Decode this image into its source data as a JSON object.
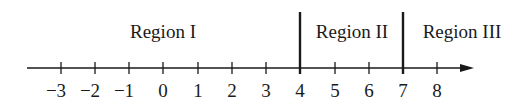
{
  "diagram": {
    "type": "number-line",
    "axis": {
      "from": -3,
      "to": 8,
      "arrow": "right"
    },
    "ticks": [
      "−3",
      "−2",
      "−1",
      "0",
      "1",
      "2",
      "3",
      "4",
      "5",
      "6",
      "7",
      "8"
    ],
    "boundaries": [
      4,
      7
    ],
    "regions": [
      {
        "label": "Region I"
      },
      {
        "label": "Region II"
      },
      {
        "label": "Region III"
      }
    ]
  }
}
